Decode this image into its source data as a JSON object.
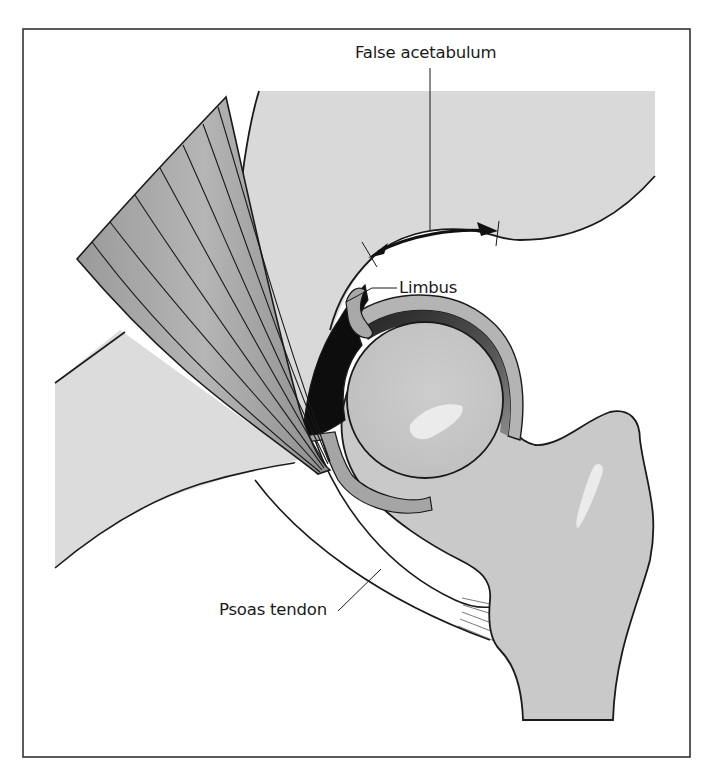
{
  "figure": {
    "colors": {
      "frame": "#333333",
      "outline": "#1a1a1a",
      "pelvis": "#d9d9d9",
      "bone": "#c9c9c9",
      "bone_highlight": "#ebebeb",
      "muscle": "#a9a9a9",
      "cartilage": "#b0b0b0",
      "cartilage_dark": "#5a5a5a",
      "limbus_black": "#0d0d0d",
      "tendon": "#ffffff",
      "background": "#ffffff"
    }
  },
  "labels": {
    "false_acetabulum": "False acetabulum",
    "limbus": "Limbus",
    "psoas_tendon": "Psoas tendon"
  }
}
